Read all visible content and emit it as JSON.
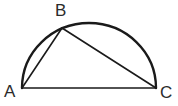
{
  "figure": {
    "kind": "geometry-diagram",
    "background_color": "#ffffff",
    "stroke_color": "#1a1a1a",
    "label_color": "#2b2b2b",
    "arc_stroke_width": 2.4,
    "chord_stroke_width": 1.6,
    "baseline_stroke_width": 1.6
  },
  "labels": {
    "a": "A",
    "b": "B",
    "c": "C"
  },
  "chart_data": {
    "type": "scatter",
    "title": "",
    "xlabel": "",
    "ylabel": "",
    "points": [
      {
        "name": "A",
        "x": 22,
        "y": 88
      },
      {
        "name": "B",
        "x": 62,
        "y": 28
      },
      {
        "name": "C",
        "x": 156,
        "y": 88
      }
    ],
    "segments": [
      {
        "name": "AC",
        "from": "A",
        "to": "C",
        "role": "diameter-baseline"
      },
      {
        "name": "AB",
        "from": "A",
        "to": "B",
        "role": "chord"
      },
      {
        "name": "BC",
        "from": "B",
        "to": "C",
        "role": "chord"
      }
    ],
    "arcs": [
      {
        "name": "semicircle-AC",
        "from": "A",
        "to": "C",
        "center_x": 89,
        "center_y": 88,
        "radius_x": 67,
        "radius_y": 65,
        "sweep": "upper-half"
      }
    ],
    "xlim": [
      0,
      178
    ],
    "ylim": [
      106,
      0
    ],
    "grid": false,
    "legend": null
  },
  "paths": {
    "arc": "M 22 88 A 67 65 0 0 1 156 88",
    "chord_ab": "M 22 88 L 62 28",
    "chord_bc": "M 62 28 L 156 88",
    "baseline_ac": "M 22 88 L 156 88"
  }
}
